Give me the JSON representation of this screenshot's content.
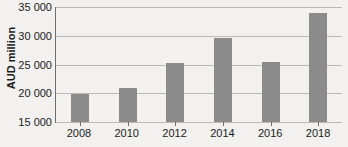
{
  "chart_data": {
    "type": "bar",
    "title": "",
    "xlabel": "",
    "ylabel": "AUD million",
    "categories": [
      "2008",
      "2010",
      "2012",
      "2014",
      "2016",
      "2018"
    ],
    "values": [
      19900,
      20900,
      25300,
      29600,
      25450,
      34000
    ],
    "ylim": [
      15000,
      35000
    ],
    "ytick_labels": [
      "35 000",
      "30 000",
      "25 000",
      "20 000",
      "15 000"
    ],
    "ytick_values": [
      35000,
      30000,
      25000,
      20000,
      15000
    ],
    "grid": true,
    "legend": "none",
    "series": [
      {
        "name": "AUD million",
        "values": [
          19900,
          20900,
          25300,
          29600,
          25450,
          34000
        ]
      }
    ],
    "colors": {
      "bar": "#8b8b8b",
      "background": "#f2f1ef",
      "gridline": "#b9b9b7",
      "axis": "#6e6e6e",
      "text": "#1b1b1b"
    }
  }
}
